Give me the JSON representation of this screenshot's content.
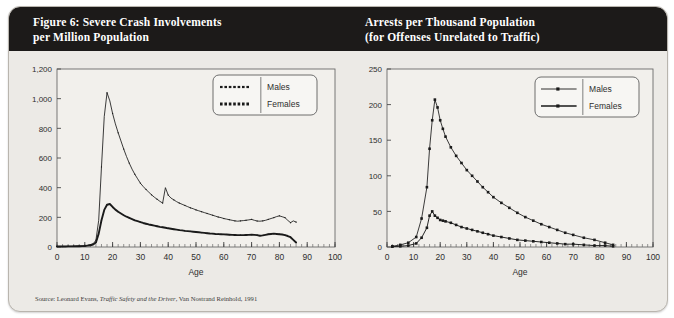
{
  "figure": {
    "left_title_line1": "Figure 6: Severe Crash Involvements",
    "left_title_line2": "per Million Population",
    "right_title_line1": "Arrests per Thousand Population",
    "right_title_line2": "(for Offenses Unrelated to Traffic)",
    "source_prefix": "Source: Leonard Evans, ",
    "source_italic": "Traffic Safety and the Driver",
    "source_suffix": ", Van Nostrand Reinhold, 1991",
    "header_color": "#1c1a19",
    "panel_color": "#eceae6",
    "plot_color": "#f2f0ec",
    "series_color": "#1a1a1a"
  },
  "chart_data": [
    {
      "id": "severe-crash",
      "type": "line",
      "title": "Figure 6: Severe Crash Involvements per Million Population",
      "xlabel": "Age",
      "ylabel": "",
      "xlim": [
        0,
        100
      ],
      "ylim": [
        0,
        1200
      ],
      "xticks": [
        0,
        10,
        20,
        30,
        40,
        50,
        60,
        70,
        80,
        90,
        100
      ],
      "yticks": [
        0,
        200,
        400,
        600,
        800,
        1000,
        1200
      ],
      "ytick_labels": [
        "0",
        "200",
        "400",
        "600",
        "800",
        "1,000",
        "1,200"
      ],
      "grid": false,
      "legend_position": "top-right",
      "legend": [
        "Males",
        "Females"
      ],
      "x": [
        0,
        1,
        2,
        3,
        4,
        5,
        6,
        7,
        8,
        9,
        10,
        11,
        12,
        13,
        14,
        15,
        16,
        17,
        18,
        19,
        20,
        21,
        22,
        23,
        24,
        25,
        26,
        27,
        28,
        29,
        30,
        31,
        32,
        33,
        34,
        35,
        36,
        37,
        38,
        39,
        40,
        41,
        42,
        43,
        44,
        45,
        46,
        47,
        48,
        49,
        50,
        51,
        52,
        53,
        54,
        55,
        56,
        57,
        58,
        59,
        60,
        61,
        62,
        63,
        64,
        65,
        66,
        67,
        68,
        69,
        70,
        71,
        72,
        73,
        74,
        75,
        76,
        77,
        78,
        79,
        80,
        81,
        82,
        83,
        84,
        85,
        86
      ],
      "series": [
        {
          "name": "Males",
          "values": [
            4,
            4,
            4,
            4,
            5,
            5,
            6,
            6,
            7,
            8,
            10,
            12,
            16,
            22,
            45,
            180,
            540,
            880,
            1040,
            985,
            900,
            830,
            770,
            715,
            660,
            610,
            565,
            525,
            490,
            460,
            430,
            408,
            388,
            370,
            352,
            336,
            322,
            308,
            296,
            400,
            350,
            330,
            318,
            306,
            296,
            288,
            280,
            272,
            264,
            258,
            250,
            244,
            238,
            232,
            226,
            220,
            214,
            208,
            202,
            198,
            192,
            188,
            184,
            180,
            176,
            174,
            176,
            178,
            180,
            183,
            186,
            180,
            175,
            174,
            176,
            180,
            186,
            192,
            198,
            205,
            210,
            204,
            198,
            180,
            164,
            176,
            168
          ]
        },
        {
          "name": "Females",
          "values": [
            3,
            3,
            3,
            3,
            4,
            4,
            4,
            5,
            5,
            6,
            7,
            9,
            12,
            17,
            30,
            90,
            180,
            250,
            285,
            290,
            270,
            252,
            238,
            226,
            214,
            204,
            196,
            188,
            180,
            174,
            168,
            162,
            157,
            152,
            148,
            144,
            140,
            136,
            133,
            130,
            126,
            123,
            120,
            117,
            114,
            112,
            109,
            107,
            105,
            103,
            101,
            99,
            97,
            95,
            93,
            91,
            90,
            88,
            87,
            86,
            85,
            84,
            83,
            82,
            81,
            80,
            80,
            80,
            81,
            82,
            83,
            82,
            80,
            76,
            78,
            82,
            86,
            88,
            90,
            88,
            86,
            84,
            80,
            74,
            66,
            48,
            30
          ]
        }
      ]
    },
    {
      "id": "arrests-per-thousand",
      "type": "line",
      "title": "Arrests per Thousand Population (for Offenses Unrelated to Traffic)",
      "xlabel": "Age",
      "ylabel": "",
      "xlim": [
        0,
        100
      ],
      "ylim": [
        0,
        250
      ],
      "xticks": [
        0,
        10,
        20,
        30,
        40,
        50,
        60,
        70,
        80,
        90,
        100
      ],
      "yticks": [
        0,
        50,
        100,
        150,
        200,
        250
      ],
      "ytick_labels": [
        "0",
        "50",
        "100",
        "150",
        "200",
        "250"
      ],
      "grid": false,
      "legend_position": "top-right",
      "legend": [
        "Males",
        "Females"
      ],
      "x": [
        2,
        5,
        8,
        11,
        13,
        15,
        16,
        17,
        18,
        19,
        20,
        21,
        22,
        24,
        26,
        28,
        30,
        32,
        34,
        36,
        38,
        40,
        43,
        46,
        49,
        52,
        55,
        58,
        61,
        64,
        67,
        70,
        74,
        78,
        82,
        85
      ],
      "series": [
        {
          "name": "Males",
          "values": [
            1,
            3,
            6,
            14,
            40,
            84,
            138,
            178,
            207,
            196,
            178,
            166,
            155,
            140,
            128,
            118,
            108,
            100,
            92,
            84,
            77,
            70,
            62,
            55,
            48,
            42,
            37,
            32,
            28,
            24,
            20,
            17,
            13,
            10,
            6,
            3
          ]
        },
        {
          "name": "Females",
          "values": [
            0.5,
            1,
            2,
            5,
            13,
            27,
            44,
            50,
            44,
            41,
            38,
            37,
            36,
            34,
            31,
            28,
            26,
            24,
            22,
            20,
            18,
            16,
            14,
            12,
            10,
            9,
            8,
            7,
            6,
            5,
            4,
            4,
            3,
            2,
            2,
            1
          ]
        }
      ]
    }
  ]
}
